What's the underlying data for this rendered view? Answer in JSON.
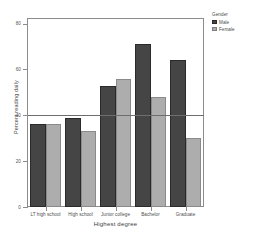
{
  "chart_data": {
    "type": "bar",
    "title": "",
    "xlabel": "Highest degree",
    "ylabel": "Percent reading daily",
    "categories": [
      "LT high school",
      "High school",
      "Junior college",
      "Bachelor",
      "Graduate"
    ],
    "series": [
      {
        "name": "Male",
        "color": "#454545",
        "values": [
          36,
          39,
          53,
          71,
          64
        ]
      },
      {
        "name": "Female",
        "color": "#adadad",
        "values": [
          36,
          33,
          56,
          48,
          30
        ]
      }
    ],
    "ylim": [
      0,
      82
    ],
    "yticks": [
      0,
      20,
      40,
      60,
      80
    ],
    "ytick_labels": [
      "0",
      "20",
      "40",
      "60",
      "80"
    ],
    "grid": false,
    "reference_line": {
      "value": 40,
      "color": "#6e6e6e"
    },
    "legend": {
      "title": "Gender",
      "position": "right-top"
    }
  },
  "legend": {
    "title": "Gender",
    "entries": [
      {
        "label": "Male"
      },
      {
        "label": "Female"
      }
    ]
  },
  "axes": {
    "x_title": "Highest degree",
    "y_title": "Percent reading daily"
  }
}
